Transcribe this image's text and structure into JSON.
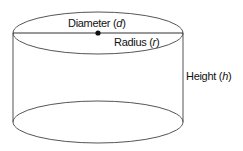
{
  "diagram": {
    "labels": {
      "diameter": "Diameter",
      "diameter_var": "d",
      "radius": "Radius",
      "radius_var": "r",
      "height": "Height",
      "height_var": "h"
    },
    "colors": {
      "stroke": "#555555",
      "text": "#111111",
      "point": "#111111"
    }
  }
}
